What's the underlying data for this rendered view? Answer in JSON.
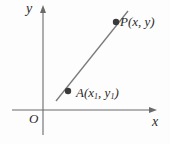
{
  "figure": {
    "type": "coordinate-geometry-diagram",
    "background_color": "#fdfdfd",
    "stroke_color": "#6b6b6b",
    "text_color": "#2b2b2b",
    "point_color": "#3a3a3a",
    "axes": {
      "x_axis_label": "x",
      "y_axis_label": "y",
      "origin_label": "O",
      "x_axis": {
        "x1": 12,
        "y1": 110,
        "x2": 157,
        "y2": 110,
        "arrow": "right"
      },
      "y_axis": {
        "x1": 43,
        "y1": 135,
        "x2": 43,
        "y2": 6,
        "arrow": "up"
      }
    },
    "line": {
      "name": "line-through-A-and-P",
      "x1": 56,
      "y1": 101,
      "x2": 128,
      "y2": 11
    },
    "points": [
      {
        "name": "point-A",
        "label_text": "A",
        "coord_x_text": "x",
        "coord_x_sub": "1",
        "coord_y_text": "y",
        "coord_y_sub": "1",
        "full_label": "A(x1, y1)",
        "cx": 68,
        "cy": 91,
        "r": 3.2
      },
      {
        "name": "point-P",
        "label_text": "P",
        "coord_x_text": "x",
        "coord_x_sub": "",
        "coord_y_text": "y",
        "coord_y_sub": "",
        "full_label": "P(x, y)",
        "cx": 116,
        "cy": 22,
        "r": 3.2
      }
    ],
    "punctuation": {
      "open_paren": "(",
      "close_paren": ")",
      "comma": ","
    }
  }
}
